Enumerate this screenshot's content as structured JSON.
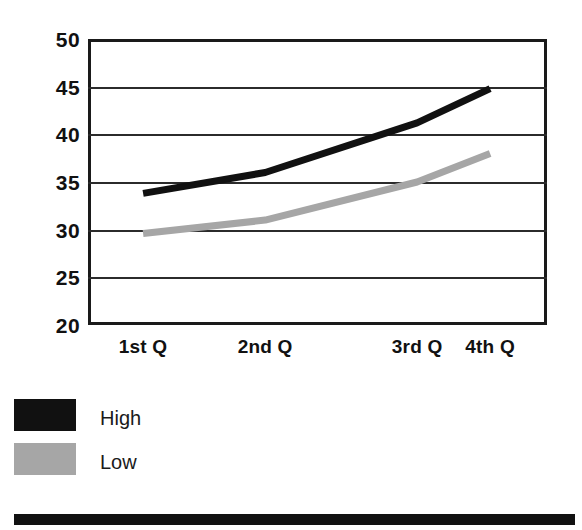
{
  "chart_data": {
    "type": "line",
    "title": "",
    "subtitle": "",
    "xlabel": "",
    "ylabel": "",
    "categories": [
      "1st Q",
      "2nd Q",
      "3rd Q",
      "4th Q"
    ],
    "series": [
      {
        "name": "High",
        "color": "#111111",
        "values": [
          33.8,
          36.0,
          41.2,
          44.8
        ]
      },
      {
        "name": "Low",
        "color": "#a6a6a6",
        "values": [
          29.6,
          31.0,
          35.0,
          38.0
        ]
      }
    ],
    "ylim": [
      20,
      50
    ],
    "yticks": [
      50,
      45,
      40,
      35,
      30,
      25,
      20
    ],
    "ytick_labels": [
      "50",
      "45",
      "40",
      "35",
      "30",
      "25",
      "20"
    ],
    "grid": true,
    "grid_axis": "y",
    "legend_position": "below-left",
    "legend_entries": [
      {
        "label": "High",
        "swatch_color": "#111111"
      },
      {
        "label": "Low",
        "swatch_color": "#a6a6a6"
      }
    ],
    "x_positions_fraction": [
      0.12,
      0.386,
      0.717,
      0.876
    ],
    "frame_color": "#1a1a1a",
    "background": "#ffffff"
  },
  "decoration": {
    "bottom_rule_color": "#111111"
  }
}
